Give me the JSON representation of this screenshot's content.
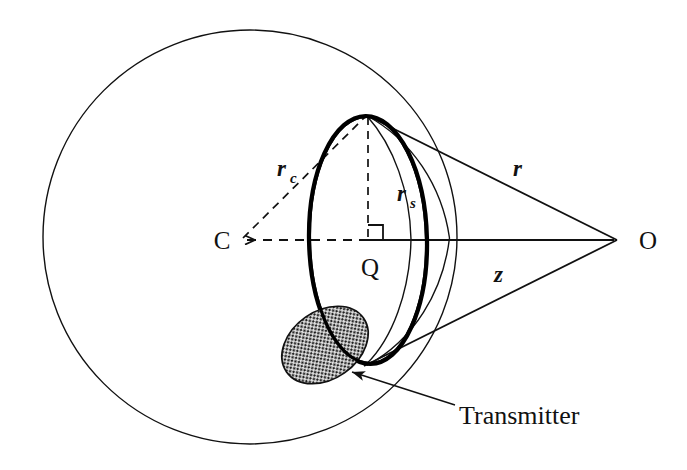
{
  "figure": {
    "background_color": "#ffffff",
    "line_color": "#111111",
    "shaded_fill": "#d9d9d9"
  },
  "labels": {
    "center_point": "C",
    "cap_center_point": "Q",
    "observer_point": "O",
    "radius_cap_base": "r",
    "radius_cap_sub": "c",
    "radius_spot_base": "r",
    "radius_spot_sub": "s",
    "slant_range": "r",
    "axial_distance": "z",
    "transmitter": "Transmitter"
  },
  "geometry": {
    "sphere_center": {
      "x": 250,
      "y": 237
    },
    "sphere_radius": 207,
    "observer": {
      "x": 617,
      "y": 240
    },
    "cap_center": {
      "x": 368,
      "y": 240
    },
    "cap_top": {
      "x": 368,
      "y": 117
    },
    "cap_bottom": {
      "x": 366,
      "y": 364
    },
    "spot_radius_end": {
      "x": 406,
      "y": 240
    },
    "transmitter_ellipse": {
      "cx": 325,
      "cy": 345,
      "rx": 46,
      "ry": 34,
      "rotation_deg": -35
    }
  }
}
